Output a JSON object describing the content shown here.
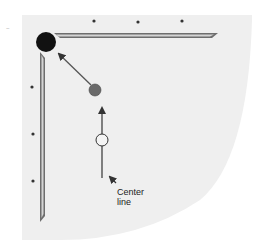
{
  "diagram": {
    "type": "billiards-shot-diagram",
    "colors": {
      "background": "#ffffff",
      "table_cloth": "#efefef",
      "rail_outer": "#6e6e6e",
      "rail_inner": "#d4d4d4",
      "pocket": "#111111",
      "object_ball": "#6a6a6a",
      "ghost_ball_stroke": "#333333",
      "line": "#333333",
      "diamond": "#333333"
    },
    "elements": {
      "pocket": {
        "name": "corner-pocket",
        "cx": 46,
        "cy": 42,
        "r": 10
      },
      "object_ball": {
        "name": "object-ball",
        "cx": 95,
        "cy": 90,
        "r": 6
      },
      "ghost_ball": {
        "name": "cue-ball-position",
        "cx": 102,
        "cy": 140,
        "r": 6
      },
      "center_line": {
        "x": 102,
        "y_start": 178,
        "y_end": 105
      },
      "aim_arrow": {
        "from": [
          91,
          85
        ],
        "to": [
          58,
          53
        ]
      },
      "top_diamonds": [
        [
          94,
          20
        ],
        [
          138,
          22
        ],
        [
          182,
          21
        ]
      ],
      "left_diamonds": [
        [
          32,
          87
        ],
        [
          33,
          134
        ],
        [
          33,
          181
        ]
      ]
    },
    "annotations": [
      {
        "text_line1": "Center",
        "text_line2": "line",
        "x": 117,
        "y": 187
      }
    ]
  }
}
